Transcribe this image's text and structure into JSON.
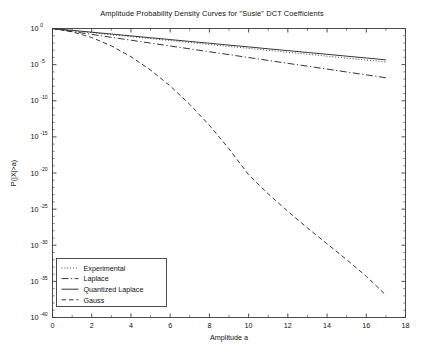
{
  "chart_data": {
    "type": "line",
    "title": "Amplitude Probability Density Curves for \"Susie\" DCT Coefficients",
    "xlabel": "Amplitude a",
    "ylabel": "P(|X|>a)",
    "xlim": [
      0,
      18
    ],
    "ylim_log10": [
      -40,
      0
    ],
    "yscale": "log",
    "grid": false,
    "legend_position": "lower left",
    "xticks": [
      0,
      2,
      4,
      6,
      8,
      10,
      12,
      14,
      16,
      18
    ],
    "xtick_labels": [
      "0",
      "2",
      "4",
      "6",
      "8",
      "10",
      "12",
      "14",
      "16",
      "18"
    ],
    "yticks_log10": [
      0,
      -5,
      -10,
      -15,
      -20,
      -25,
      -30,
      -35,
      -40
    ],
    "ytick_labels": [
      "10 0",
      "10 -5",
      "10 -10",
      "10 -15",
      "10 -20",
      "10 -25",
      "10 -30",
      "10 -35",
      "10 -40"
    ],
    "ytick_mantissa": "10",
    "ytick_exponents": [
      "0",
      "-5",
      "-10",
      "-15",
      "-20",
      "-25",
      "-30",
      "-35",
      "-40"
    ],
    "series": [
      {
        "name": "Experimental",
        "style": "dotted",
        "color": "#2b2b2b",
        "x": [
          0,
          1,
          2,
          3,
          4,
          5,
          6,
          7,
          8,
          9,
          10,
          11,
          12,
          13,
          14,
          15,
          16,
          17
        ],
        "log10y": [
          0.0,
          -0.3,
          -0.58,
          -0.86,
          -1.13,
          -1.4,
          -1.67,
          -1.94,
          -2.21,
          -2.48,
          -2.75,
          -3.02,
          -3.29,
          -3.56,
          -3.83,
          -4.1,
          -4.37,
          -4.64
        ]
      },
      {
        "name": "Laplace",
        "style": "dashdot",
        "color": "#2b2b2b",
        "x": [
          0,
          1,
          2,
          3,
          4,
          5,
          6,
          7,
          8,
          9,
          10,
          11,
          12,
          13,
          14,
          15,
          16,
          17
        ],
        "log10y": [
          0.0,
          -0.42,
          -0.82,
          -1.22,
          -1.62,
          -2.02,
          -2.42,
          -2.82,
          -3.22,
          -3.62,
          -4.02,
          -4.42,
          -4.82,
          -5.22,
          -5.62,
          -6.02,
          -6.42,
          -6.82
        ]
      },
      {
        "name": "Quantized Laplace",
        "style": "solid",
        "color": "#2b2b2b",
        "x": [
          0,
          1,
          2,
          3,
          4,
          5,
          6,
          7,
          8,
          9,
          10,
          11,
          12,
          13,
          14,
          15,
          16,
          17
        ],
        "log10y": [
          0.0,
          -0.26,
          -0.51,
          -0.77,
          -1.02,
          -1.28,
          -1.53,
          -1.79,
          -2.04,
          -2.3,
          -2.55,
          -2.81,
          -3.06,
          -3.32,
          -3.57,
          -3.83,
          -4.08,
          -4.34
        ]
      },
      {
        "name": "Gauss",
        "style": "dashed",
        "color": "#2b2b2b",
        "x": [
          0,
          1,
          2,
          3,
          4,
          5,
          6,
          7,
          8,
          9,
          10,
          11,
          12,
          13,
          14,
          15,
          16,
          17
        ],
        "log10y": [
          0.0,
          -0.45,
          -1.25,
          -2.4,
          -3.9,
          -5.75,
          -7.95,
          -10.5,
          -13.4,
          -16.65,
          -20.25,
          -22.9,
          -25.3,
          -27.6,
          -29.8,
          -32.0,
          -34.3,
          -36.9
        ]
      }
    ],
    "legend": [
      {
        "label": "Experimental",
        "style": "dotted"
      },
      {
        "label": "Laplace",
        "style": "dashdot"
      },
      {
        "label": "Quantized Laplace",
        "style": "solid"
      },
      {
        "label": "Gauss",
        "style": "dashed"
      }
    ]
  },
  "colors": {
    "background": "#ffffff",
    "axis": "#3a3a3a",
    "ink": "#1a1a1a",
    "line": "#2b2b2b"
  }
}
